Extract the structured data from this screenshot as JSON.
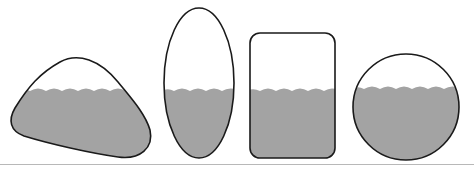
{
  "diagram": {
    "colors": {
      "background": "#ffffff",
      "outline": "#1a1a1a",
      "liquid": "#a3a3a3",
      "ground_line": "#b8b8b8"
    },
    "containers": [
      {
        "name": "tilted-blob-container",
        "shape": "tilted oval blob"
      },
      {
        "name": "tall-ellipse-container",
        "shape": "tall ellipse"
      },
      {
        "name": "rounded-rectangle-container",
        "shape": "rounded rectangle"
      },
      {
        "name": "circle-container",
        "shape": "circle"
      }
    ],
    "liquid_level_y": 90
  }
}
